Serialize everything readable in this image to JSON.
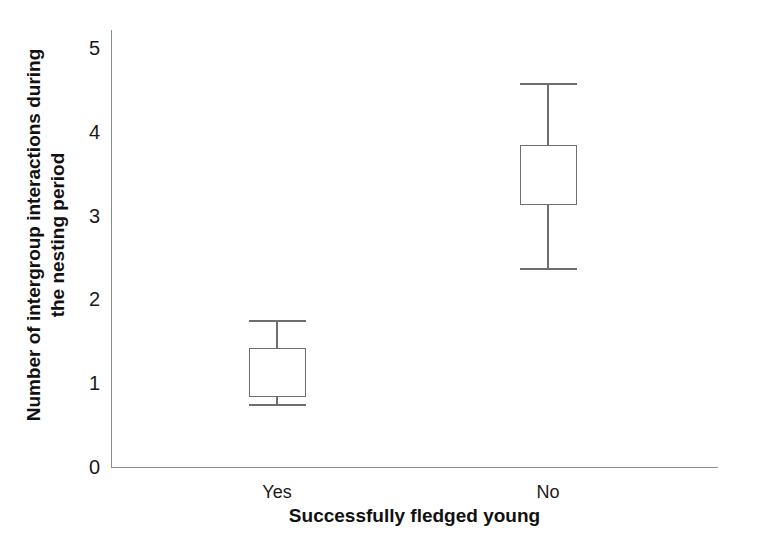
{
  "chart_data": {
    "type": "box",
    "title": "",
    "xlabel": "Successfully fledged young",
    "ylabel_line1": "Number of intergroup interactions during",
    "ylabel_line2": "the nesting period",
    "categories": [
      "Yes",
      "No"
    ],
    "ytick_labels": [
      "5",
      "4",
      "3",
      "2",
      "1",
      "0"
    ],
    "ytick_values": [
      5,
      4,
      3,
      2,
      1,
      0
    ],
    "ylim": [
      0,
      5.22
    ],
    "grid": false,
    "legend": null,
    "box_color": "#6e6e6e",
    "box_fill": "#ffffff",
    "axis_color": "#8d8d8d",
    "boxes": [
      {
        "category": "Yes",
        "whisker_low": 0.75,
        "q1": 0.83,
        "median": 1.05,
        "q3": 1.42,
        "whisker_high": 1.76,
        "show_median_line": false
      },
      {
        "category": "No",
        "whisker_low": 2.38,
        "q1": 3.13,
        "median": 3.5,
        "q3": 3.84,
        "whisker_high": 4.58,
        "show_median_line": false
      }
    ]
  },
  "axis": {
    "y_title_line1": "Number of intergroup interactions during",
    "y_title_line2": "the nesting period",
    "x_title": "Successfully fledged young",
    "yticks": [
      {
        "label": "5",
        "value": 5
      },
      {
        "label": "4",
        "value": 4
      },
      {
        "label": "3",
        "value": 3
      },
      {
        "label": "2",
        "value": 2
      },
      {
        "label": "1",
        "value": 1
      },
      {
        "label": "0",
        "value": 0
      }
    ],
    "xticks": [
      {
        "label": "Yes"
      },
      {
        "label": "No"
      }
    ]
  }
}
